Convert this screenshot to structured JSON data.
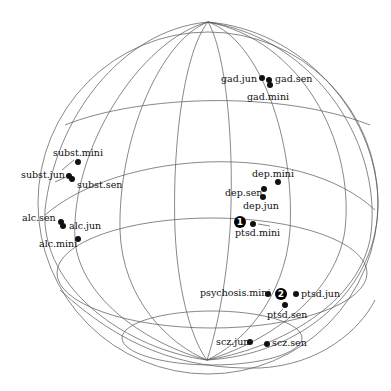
{
  "figure": {
    "type": "sphere-projection",
    "sphere": {
      "cx": 208,
      "cy": 203,
      "r": 170
    },
    "grid_color": "#555555",
    "point_color": "#111111"
  },
  "points": [
    {
      "id": "gad-jun",
      "label": "gad.jun",
      "x": 262,
      "y": 78,
      "lx": 257,
      "ly": 82,
      "anchor": "end"
    },
    {
      "id": "gad-sen",
      "label": "gad.sen",
      "x": 269,
      "y": 80,
      "lx": 275,
      "ly": 82,
      "anchor": "start"
    },
    {
      "id": "gad-mini",
      "label": "gad.mini",
      "x": 270,
      "y": 85,
      "lx": 247,
      "ly": 100,
      "anchor": "start"
    },
    {
      "id": "subst-mini",
      "label": "subst.mini",
      "x": 78,
      "y": 162,
      "lx": 53,
      "ly": 156,
      "anchor": "start"
    },
    {
      "id": "subst-jun",
      "label": "subst.jun",
      "x": 69,
      "y": 176,
      "lx": 21,
      "ly": 178,
      "anchor": "start"
    },
    {
      "id": "subst-sen",
      "label": "subst.sen",
      "x": 72,
      "y": 179,
      "lx": 77,
      "ly": 188,
      "anchor": "start"
    },
    {
      "id": "alc-sen",
      "label": "alc.sen",
      "x": 61,
      "y": 222,
      "lx": 22,
      "ly": 221,
      "anchor": "start"
    },
    {
      "id": "alc-jun",
      "label": "alc.jun",
      "x": 63,
      "y": 226,
      "lx": 69,
      "ly": 229,
      "anchor": "start"
    },
    {
      "id": "alc-mini",
      "label": "alc.mini",
      "x": 78,
      "y": 239,
      "lx": 39,
      "ly": 247,
      "anchor": "start"
    },
    {
      "id": "dep-mini",
      "label": "dep.mini",
      "x": 278,
      "y": 182,
      "lx": 252,
      "ly": 177,
      "anchor": "start"
    },
    {
      "id": "dep-sen",
      "label": "dep.sen",
      "x": 264,
      "y": 189,
      "lx": 225,
      "ly": 196,
      "anchor": "start"
    },
    {
      "id": "dep-jun",
      "label": "dep.jun",
      "x": 263,
      "y": 197,
      "lx": 243,
      "ly": 209,
      "anchor": "start"
    },
    {
      "id": "ptsd-mini",
      "label": "ptsd.mini",
      "x": 253,
      "y": 224,
      "lx": 235,
      "ly": 236,
      "anchor": "start"
    },
    {
      "id": "psychosis-mini",
      "label": "psychosis.mini",
      "x": 268,
      "y": 294,
      "lx": 200,
      "ly": 296,
      "anchor": "start"
    },
    {
      "id": "ptsd-jun",
      "label": "ptsd.jun",
      "x": 296,
      "y": 294,
      "lx": 301,
      "ly": 297,
      "anchor": "start"
    },
    {
      "id": "ptsd-sen",
      "label": "ptsd.sen",
      "x": 285,
      "y": 305,
      "lx": 267,
      "ly": 318,
      "anchor": "start"
    },
    {
      "id": "scz-jun",
      "label": "scz.jun",
      "x": 250,
      "y": 342,
      "lx": 216,
      "ly": 345,
      "anchor": "start"
    },
    {
      "id": "scz-sen",
      "label": "scz.sen",
      "x": 267,
      "y": 344,
      "lx": 272,
      "ly": 346,
      "anchor": "start"
    }
  ],
  "markers": [
    {
      "id": "marker-1",
      "number": "1",
      "x": 240,
      "y": 222,
      "r": 6
    },
    {
      "id": "marker-2",
      "number": "2",
      "x": 281,
      "y": 294,
      "r": 6
    }
  ]
}
